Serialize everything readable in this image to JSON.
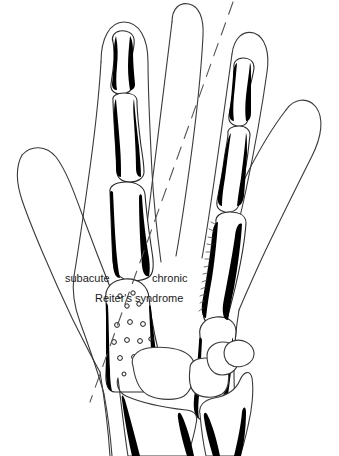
{
  "figure": {
    "kind": "medical-line-illustration",
    "background_color": "#ffffff",
    "outline_color": "#3a3a3a",
    "bone_outline_color": "#2a2a2a",
    "lesion_color": "#000000",
    "text_color": "#1a1a1a",
    "divider": {
      "style": "dashed",
      "name": "diagonal-divider-line",
      "from": [
        233,
        2
      ],
      "to": [
        90,
        402
      ]
    }
  },
  "labels": {
    "left_side": "subacute",
    "right_side": "chronic",
    "caption": "Reiter's syndrome"
  },
  "annotations": {
    "subacute_features": "periosteal reaction with stippled erosions at metacarpal head",
    "chronic_features": "solid periosteal new bone along proximal phalanx and metacarpal",
    "wrist_features": "carpal bones with periosteal streaks on distal radius and ulna"
  }
}
